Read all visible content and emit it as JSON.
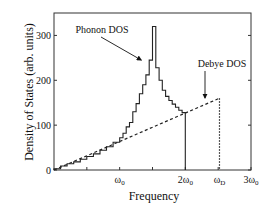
{
  "chart_data": {
    "type": "line",
    "title": "",
    "xlabel": "Frequency",
    "ylabel": "Density of States (arb. units)",
    "xlim": [
      0,
      3
    ],
    "ylim": [
      0,
      350
    ],
    "grid": false,
    "legend": null,
    "x_unit": "omega_0",
    "x_ticks": [
      {
        "value": 1,
        "label": "ω",
        "sub": "0",
        "prefix": ""
      },
      {
        "value": 2,
        "label": "ω",
        "sub": "0",
        "prefix": "2"
      },
      {
        "value": 2.52,
        "label": "ω",
        "sub": "D",
        "prefix": ""
      },
      {
        "value": 3,
        "label": "ω",
        "sub": "0",
        "prefix": "3"
      }
    ],
    "x_minor_ticks": [
      0.5,
      1,
      1.5,
      2,
      2.5,
      3
    ],
    "y_ticks": [
      0,
      100,
      200,
      300
    ],
    "series": [
      {
        "name": "Phonon DOS",
        "style": "solid-step",
        "bin_edges": [
          0,
          0.1,
          0.2,
          0.3,
          0.4,
          0.5,
          0.6,
          0.7,
          0.8,
          0.9,
          1.0,
          1.05,
          1.1,
          1.15,
          1.2,
          1.25,
          1.3,
          1.35,
          1.4,
          1.45,
          1.5,
          1.55,
          1.6,
          1.65,
          1.7,
          1.75,
          1.8,
          1.85,
          1.9,
          1.95,
          2.0
        ],
        "values": [
          3,
          9,
          14,
          18,
          24,
          30,
          36,
          44,
          52,
          62,
          72,
          82,
          96,
          106,
          130,
          148,
          170,
          190,
          212,
          245,
          320,
          228,
          200,
          178,
          164,
          155,
          147,
          140,
          133,
          128
        ]
      },
      {
        "name": "Debye DOS",
        "style": "dashed",
        "x": [
          0,
          2.52,
          2.52
        ],
        "y": [
          0,
          160,
          0
        ]
      }
    ],
    "annotations": [
      {
        "text": "Phonon DOS",
        "target_x": 1.36,
        "target_y": 245
      },
      {
        "text": "Debye DOS",
        "target_x": 2.3,
        "target_y": 160
      }
    ]
  }
}
